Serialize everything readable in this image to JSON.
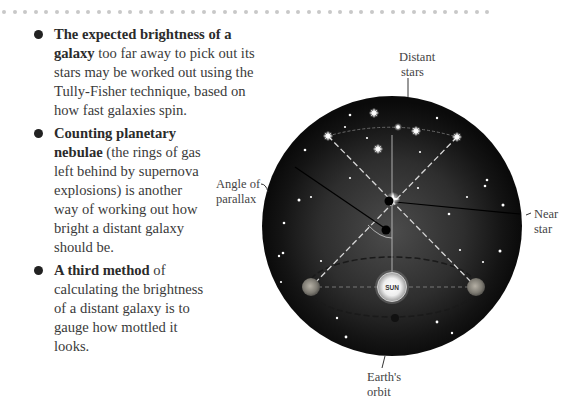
{
  "bullets": [
    {
      "bold": "The expected brightness of a galaxy",
      "text": " too far away to pick out its stars may be worked out using the Tully-Fisher technique, based on how fast galaxies spin."
    },
    {
      "bold": "Counting planetary nebulae",
      "text": " (the rings of gas left behind by supernova explosions) is another way of working out how bright a distant galaxy should be."
    },
    {
      "bold": "A third method",
      "text": " of calculating the brightness of a distant galaxy is to gauge how mottled it looks."
    }
  ],
  "diagram": {
    "labels": {
      "distant_stars_1": "Distant",
      "distant_stars_2": "stars",
      "angle_1": "Angle of",
      "angle_2": "parallax",
      "near_star_1": "Near",
      "near_star_2": "star",
      "earths_orbit_1": "Earth's",
      "earths_orbit_2": "orbit",
      "sun": "SUN"
    },
    "colors": {
      "sky": "#0d0d0d",
      "sky_glow": "#4a4a4a",
      "earth": "#8a8a80",
      "sun": "#f4f4f4",
      "dashed": "#d8d8d8"
    }
  }
}
